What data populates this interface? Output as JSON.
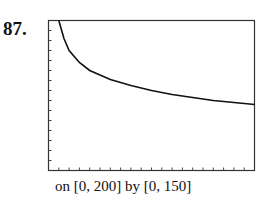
{
  "problem_number": "87.",
  "caption": "on [0, 200] by [0, 150]",
  "chart_data": {
    "type": "line",
    "title": "",
    "xlabel": "",
    "ylabel": "",
    "xlim": [
      0,
      200
    ],
    "ylim": [
      0,
      150
    ],
    "x_tick_step": 10,
    "y_tick_step": 10,
    "grid": false,
    "legend": null,
    "series": [
      {
        "name": "curve",
        "x": [
          10,
          15,
          20,
          30,
          40,
          60,
          80,
          100,
          120,
          140,
          160,
          180,
          200
        ],
        "values": [
          150,
          132,
          120,
          108,
          100,
          91,
          85,
          80,
          76,
          73,
          70,
          68,
          66
        ]
      }
    ]
  }
}
